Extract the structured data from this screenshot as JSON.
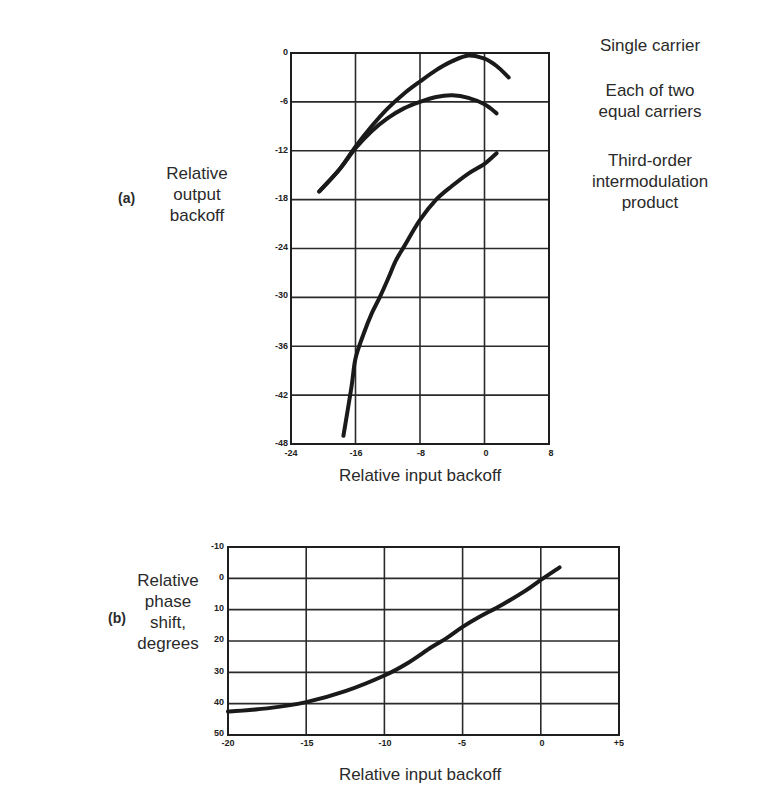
{
  "panel_a": {
    "tag": "(a)",
    "ylabel_lines": [
      "Relative",
      "output",
      "backoff"
    ],
    "xlabel": "Relative input backoff",
    "legend": [
      "Single carrier",
      "Each of two equal carriers",
      "Third-order intermodulation product"
    ],
    "legend_lines": {
      "single": [
        "Single carrier"
      ],
      "two": [
        "Each of two",
        "equal carriers"
      ],
      "im3": [
        "Third-order",
        "intermodulation",
        "product"
      ]
    },
    "xticks": [
      "-24",
      "-16",
      "-8",
      "0",
      "8"
    ],
    "yticks": [
      "0",
      "-6",
      "-12",
      "-18",
      "-24",
      "-30",
      "-36",
      "-42",
      "-48"
    ]
  },
  "panel_b": {
    "tag": "(b)",
    "ylabel_lines": [
      "Relative",
      "phase",
      "shift,",
      "degrees"
    ],
    "xlabel": "Relative input backoff",
    "xticks": [
      "-20",
      "-15",
      "-10",
      "-5",
      "0",
      "+5"
    ],
    "yticks": [
      "-10",
      "0",
      "10",
      "20",
      "30",
      "40",
      "50"
    ]
  },
  "chart_data": [
    {
      "type": "line",
      "title": "(a)",
      "xlabel": "Relative input backoff",
      "ylabel": "Relative output backoff",
      "xlim": [
        -24,
        8
      ],
      "ylim": [
        -48,
        0
      ],
      "xticks": [
        -24,
        -16,
        -8,
        0,
        8
      ],
      "yticks": [
        0,
        -6,
        -12,
        -18,
        -24,
        -30,
        -36,
        -42,
        -48
      ],
      "grid": true,
      "legend_position": "right (annotations)",
      "series": [
        {
          "name": "Single carrier",
          "x": [
            -20.5,
            -18,
            -16,
            -14,
            -12,
            -10,
            -8,
            -6,
            -4,
            -2,
            0,
            1.5,
            3
          ],
          "y": [
            -17,
            -14.3,
            -11.5,
            -9,
            -6.8,
            -5,
            -3.5,
            -2.1,
            -1,
            -0.3,
            -0.7,
            -1.6,
            -3
          ]
        },
        {
          "name": "Each of two equal carriers",
          "x": [
            -20.5,
            -18,
            -16,
            -14,
            -12,
            -10,
            -8,
            -6,
            -4,
            -2,
            0,
            1.5
          ],
          "y": [
            -17,
            -14.3,
            -11.7,
            -9.6,
            -8,
            -6.8,
            -6,
            -5.4,
            -5.2,
            -5.5,
            -6.3,
            -7.4
          ]
        },
        {
          "name": "Third-order intermodulation product",
          "x": [
            -17.5,
            -16.5,
            -16,
            -15,
            -14,
            -13,
            -12,
            -11,
            -10,
            -8,
            -6,
            -4,
            -2,
            0,
            1.5
          ],
          "y": [
            -47,
            -41,
            -37.5,
            -34.5,
            -32,
            -30,
            -27.8,
            -25.5,
            -23.8,
            -20.5,
            -18,
            -16.3,
            -14.8,
            -13.6,
            -12.3
          ]
        }
      ]
    },
    {
      "type": "line",
      "title": "(b)",
      "xlabel": "Relative input backoff",
      "ylabel": "Relative phase shift, degrees",
      "xlim": [
        -20,
        5
      ],
      "ylim": [
        50,
        -10
      ],
      "xticks": [
        -20,
        -15,
        -10,
        -5,
        0,
        5
      ],
      "yticks": [
        -10,
        0,
        10,
        20,
        30,
        40,
        50
      ],
      "grid": true,
      "series": [
        {
          "name": "Phase shift",
          "x": [
            -20,
            -17.5,
            -15,
            -12.5,
            -10,
            -8.5,
            -7,
            -6,
            -5,
            -4,
            -2.5,
            -1,
            0,
            1.2
          ],
          "y": [
            42.5,
            41.5,
            39.5,
            36,
            31,
            27,
            22,
            19,
            15.5,
            12.5,
            8.5,
            4,
            0.5,
            -3.5
          ]
        }
      ]
    }
  ]
}
